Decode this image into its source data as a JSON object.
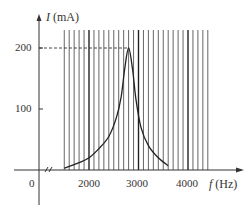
{
  "chart_data": {
    "type": "line",
    "title": "",
    "xlabel": "f (Hz)",
    "ylabel": "I (mA)",
    "x_axis_symbol": "f",
    "x_axis_unit": "(Hz)",
    "y_axis_symbol": "I",
    "y_axis_unit": "(mA)",
    "x_ticks": [
      "0",
      "2000",
      "3000",
      "4000"
    ],
    "y_ticks": [
      "100",
      "200"
    ],
    "x_axis_break": true,
    "xlim": [
      1500,
      4400
    ],
    "ylim": [
      0,
      230
    ],
    "grid": "vertical lines every 100 Hz from ~1500 Hz to ~4400 Hz (major at 2000, 3000, 4000)",
    "reference_line": {
      "y": 200,
      "style": "dashed",
      "label": "200"
    },
    "series": [
      {
        "name": "I vs f (resonance curve)",
        "x": [
          1500,
          1800,
          2000,
          2200,
          2400,
          2550,
          2650,
          2720,
          2800,
          2880,
          2950,
          3050,
          3200,
          3400,
          3600
        ],
        "values": [
          3,
          12,
          20,
          35,
          55,
          85,
          120,
          165,
          200,
          165,
          115,
          70,
          40,
          20,
          7
        ]
      }
    ],
    "peak": {
      "x": 2800,
      "y": 200
    }
  }
}
